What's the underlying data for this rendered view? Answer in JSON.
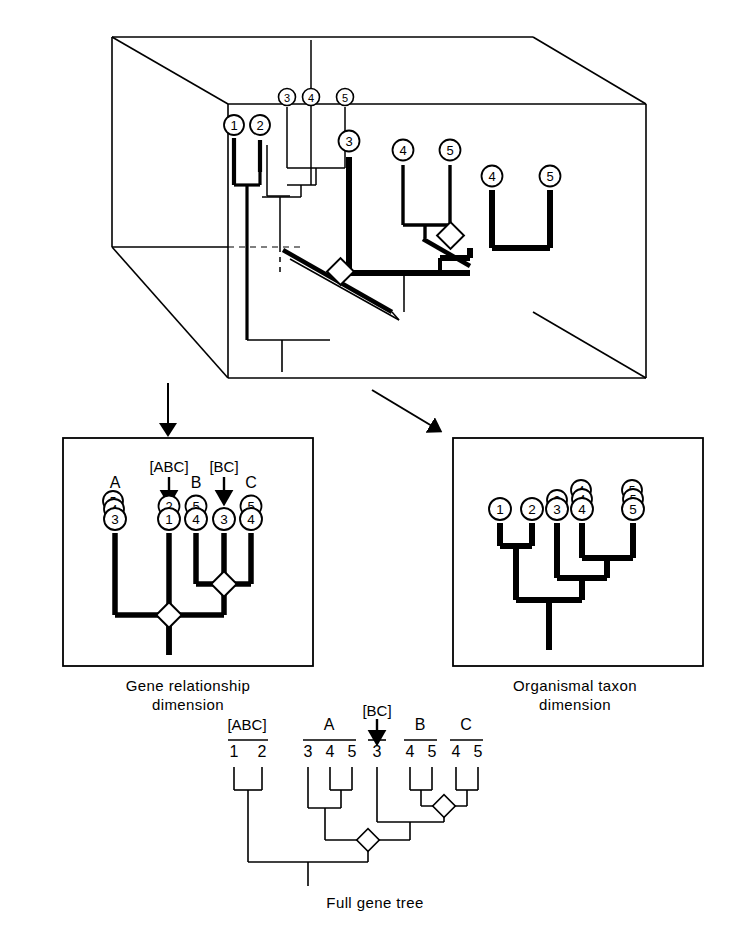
{
  "figure": {
    "type": "phylogenetic-diagram"
  },
  "cube_panel": {
    "name": "three-dimensional-gene-tree-cube",
    "back_plane_tips": [
      "3",
      "4",
      "5"
    ],
    "front_left_tips": [
      "1",
      "2"
    ],
    "front_right_tips": [
      "3",
      "4",
      "5",
      "4",
      "5"
    ],
    "duplication_nodes": 2
  },
  "arrows": {
    "left_label": "",
    "right_label": ""
  },
  "left_panel": {
    "caption": "Gene relationship\ndimension",
    "top_labels": [
      "[ABC]",
      "[BC]"
    ],
    "tip_labels": [
      "A",
      "B",
      "C"
    ],
    "tips": [
      {
        "label": "A",
        "stack": [
          "5",
          "4",
          "3"
        ]
      },
      {
        "label": "[ABC]",
        "stack": [
          "2",
          "1"
        ]
      },
      {
        "label": "B",
        "stack": [
          "5",
          "4"
        ]
      },
      {
        "label": "[BC]",
        "stack": [
          "3"
        ]
      },
      {
        "label": "C",
        "stack": [
          "5",
          "4"
        ]
      }
    ],
    "duplication_nodes": 2
  },
  "right_panel": {
    "caption": "Organismal taxon\ndimension",
    "tips": [
      {
        "label": "1",
        "stack": [
          "1"
        ]
      },
      {
        "label": "2",
        "stack": [
          "2"
        ]
      },
      {
        "label": "3",
        "stack": [
          "3",
          "3"
        ]
      },
      {
        "label": "4",
        "stack": [
          "4",
          "4",
          "4"
        ]
      },
      {
        "label": "5",
        "stack": [
          "5",
          "5",
          "5"
        ]
      }
    ],
    "duplication_nodes": 0
  },
  "bottom_panel": {
    "caption": "Full gene tree",
    "groups": [
      {
        "label": "[ABC]",
        "members": [
          "1",
          "2"
        ]
      },
      {
        "label": "A",
        "members": [
          "3",
          "4",
          "5"
        ]
      },
      {
        "label": "[BC]",
        "members": [
          "3"
        ]
      },
      {
        "label": "B",
        "members": [
          "4",
          "5"
        ]
      },
      {
        "label": "C",
        "members": [
          "4",
          "5"
        ]
      }
    ],
    "duplication_nodes": 2
  },
  "colors": {
    "ink": "#000000",
    "paper": "#ffffff"
  }
}
